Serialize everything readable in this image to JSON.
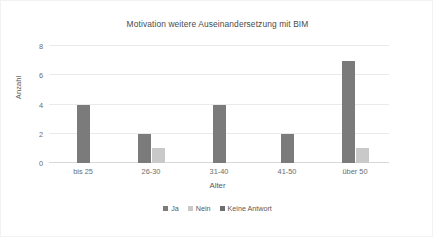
{
  "chart_data": {
    "type": "bar",
    "title": "Motivation weitere Auseinandersetzung mit BIM",
    "xlabel": "Alter",
    "ylabel": "Anzahl",
    "categories": [
      "bis 25",
      "26-30",
      "31-40",
      "41-50",
      "über 50"
    ],
    "series": [
      {
        "name": "Ja",
        "values": [
          4,
          2,
          4,
          2,
          7
        ],
        "color": "#7b7b7b"
      },
      {
        "name": "Nein",
        "values": [
          0,
          1,
          0,
          0,
          1
        ],
        "color": "#c9c9c9"
      },
      {
        "name": "Keine Antwort",
        "values": [
          0,
          0,
          0,
          0,
          0
        ],
        "color": "#6e6e6e"
      }
    ],
    "ylim": [
      0,
      8
    ],
    "yticks": [
      0,
      2,
      4,
      6,
      8
    ],
    "ytick_labels": [
      "0",
      "2",
      "4",
      "6",
      "8"
    ],
    "grid": true,
    "legend_position": "bottom"
  },
  "frame": {
    "border_color": "#f2f2f2",
    "background": "#ffffff"
  }
}
